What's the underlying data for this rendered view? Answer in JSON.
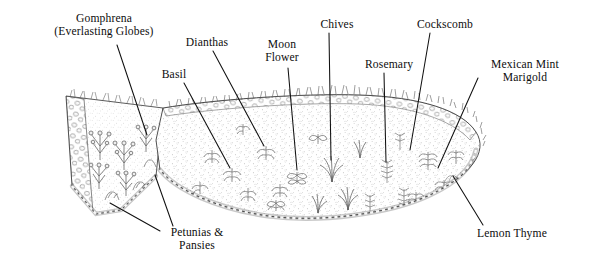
{
  "figure": {
    "kind": "garden-bed-planting-diagram",
    "medium": "pen-and-ink line drawing",
    "palette": {
      "background": "#ffffff",
      "ink": "#1a1a1a",
      "soil_tone": "#8d8d8d",
      "stone_tone": "#9a9a9a",
      "foliage_tone": "#6f6f6f",
      "leader_line": "#111111"
    }
  },
  "labels": [
    {
      "name": "gomphrena",
      "lines": [
        "Gomphrena",
        "(Everlasting Globes)"
      ],
      "text_x": 30,
      "text_y": 12,
      "text_w": 148,
      "align": "center",
      "leader": [
        [
          117,
          45
        ],
        [
          147,
          135
        ]
      ]
    },
    {
      "name": "basil",
      "lines": [
        "Basil"
      ],
      "text_x": 152,
      "text_y": 68,
      "text_w": 44,
      "align": "center",
      "leader": [
        [
          184,
          83
        ],
        [
          230,
          168
        ]
      ]
    },
    {
      "name": "dianthas",
      "lines": [
        "Dianthas"
      ],
      "text_x": 176,
      "text_y": 36,
      "text_w": 62,
      "align": "center",
      "leader": [
        [
          213,
          51
        ],
        [
          264,
          146
        ]
      ]
    },
    {
      "name": "moon-flower",
      "lines": [
        "Moon",
        "Flower"
      ],
      "text_x": 255,
      "text_y": 38,
      "text_w": 54,
      "align": "center",
      "leader": [
        [
          288,
          68
        ],
        [
          297,
          170
        ]
      ]
    },
    {
      "name": "chives",
      "lines": [
        "Chives"
      ],
      "text_x": 313,
      "text_y": 18,
      "text_w": 48,
      "align": "center",
      "leader": [
        [
          329,
          33
        ],
        [
          331,
          160
        ]
      ]
    },
    {
      "name": "rosemary",
      "lines": [
        "Rosemary"
      ],
      "text_x": 355,
      "text_y": 58,
      "text_w": 68,
      "align": "center",
      "leader": [
        [
          384,
          73
        ],
        [
          386,
          162
        ]
      ]
    },
    {
      "name": "cockscomb",
      "lines": [
        "Cockscomb"
      ],
      "text_x": 406,
      "text_y": 18,
      "text_w": 78,
      "align": "center",
      "leader": [
        [
          430,
          33
        ],
        [
          410,
          150
        ]
      ]
    },
    {
      "name": "mexican-mint-marigold",
      "lines": [
        "Mexican Mint",
        "Marigold"
      ],
      "text_x": 478,
      "text_y": 58,
      "text_w": 94,
      "align": "center",
      "leader": [
        [
          478,
          78
        ],
        [
          438,
          168
        ]
      ]
    },
    {
      "name": "lemon-thyme",
      "lines": [
        "Lemon Thyme"
      ],
      "text_x": 466,
      "text_y": 227,
      "text_w": 92,
      "align": "center",
      "leader": [
        [
          483,
          225
        ],
        [
          453,
          176
        ]
      ]
    },
    {
      "name": "petunias-pansies",
      "lines": [
        "Petunias &",
        "Pansies"
      ],
      "text_x": 158,
      "text_y": 226,
      "text_w": 78,
      "align": "center",
      "leader": [
        [
          160,
          231
        ],
        [
          110,
          203
        ]
      ],
      "leader2": [
        [
          173,
          226
        ],
        [
          155,
          175
        ]
      ]
    }
  ],
  "plant_beds": [
    {
      "name": "left-wedge-bed",
      "shape": "narrow tapering wedge ending in a rounded point at lower left"
    },
    {
      "name": "right-main-bed",
      "shape": "broad rounded-triangular bed with cobblestone edging"
    }
  ]
}
